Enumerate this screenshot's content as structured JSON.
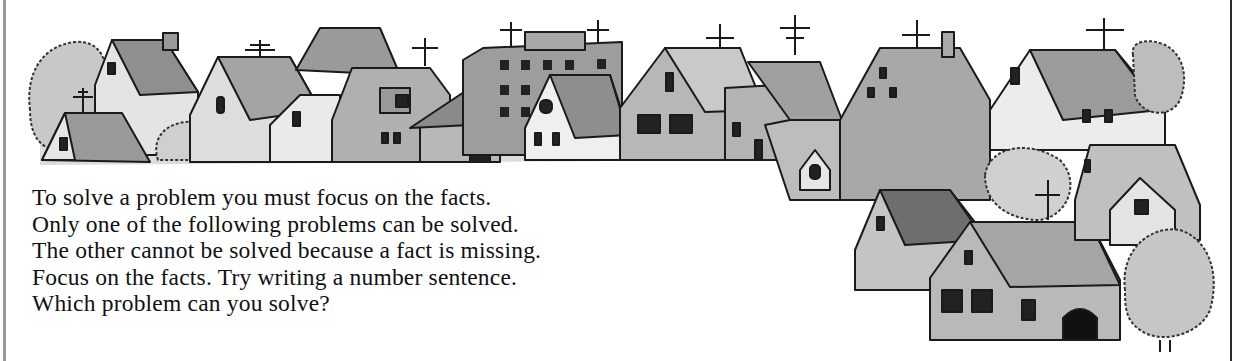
{
  "illustration": {
    "subject": "row of houses in a town with TV antennas and trees",
    "style": "grayscale watercolor ink drawing",
    "colors": {
      "outline": "#1a1a1a",
      "roof_dark": "#7d7d7d",
      "roof_mid": "#9c9c9c",
      "wall_light": "#e3e3e3",
      "wall_mid": "#b5b5b5",
      "tree": "#c4c4c4",
      "window": "#222222"
    }
  },
  "instructions": {
    "lines": [
      "To solve a problem you must focus on the facts.",
      "Only one of the following problems can be solved.",
      "The other cannot be solved because a fact is missing.",
      "Focus on the facts. Try writing a number sentence.",
      "Which problem can you solve?"
    ]
  }
}
